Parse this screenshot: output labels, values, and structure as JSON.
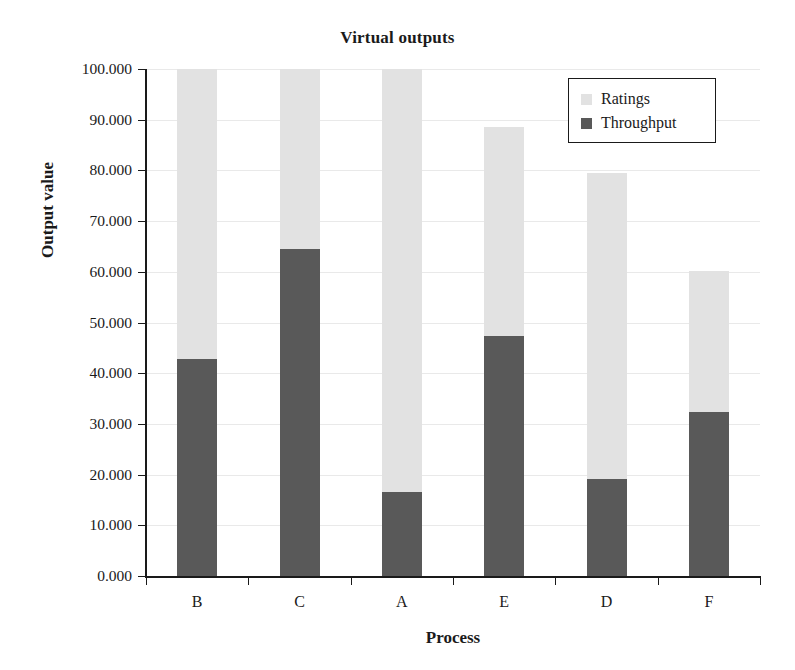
{
  "chart_data": {
    "type": "bar",
    "stacked": true,
    "title": "Virtual outputs",
    "xlabel": "Process",
    "ylabel": "Output value",
    "categories": [
      "B",
      "C",
      "A",
      "E",
      "D",
      "F"
    ],
    "series": [
      {
        "name": "Throughput",
        "color": "#595959",
        "values": [
          42.8,
          64.5,
          16.6,
          47.4,
          19.1,
          32.3
        ]
      },
      {
        "name": "Ratings",
        "color": "#e2e2e2",
        "values": [
          57.2,
          35.5,
          83.4,
          41.1,
          60.4,
          27.9
        ]
      }
    ],
    "totals": [
      100.0,
      100.0,
      100.0,
      88.5,
      79.5,
      60.2
    ],
    "ylim": [
      0,
      100
    ],
    "ytick_values": [
      0,
      10,
      20,
      30,
      40,
      50,
      60,
      70,
      80,
      90,
      100
    ],
    "ytick_labels": [
      "0.000",
      "10.000",
      "20.000",
      "30.000",
      "40.000",
      "50.000",
      "60.000",
      "70.000",
      "80.000",
      "90.000",
      "100.000"
    ],
    "grid": true,
    "grid_color": "#e9e9e9",
    "legend_position": "top-right",
    "legend_entries": [
      "Ratings",
      "Throughput"
    ],
    "axis_color": "#1a1a1a",
    "background": "#ffffff"
  },
  "legend": {
    "ratings_label": "Ratings",
    "throughput_label": "Throughput"
  },
  "titles": {
    "chart": "Virtual outputs",
    "x_axis": "Process",
    "y_axis": "Output value"
  }
}
